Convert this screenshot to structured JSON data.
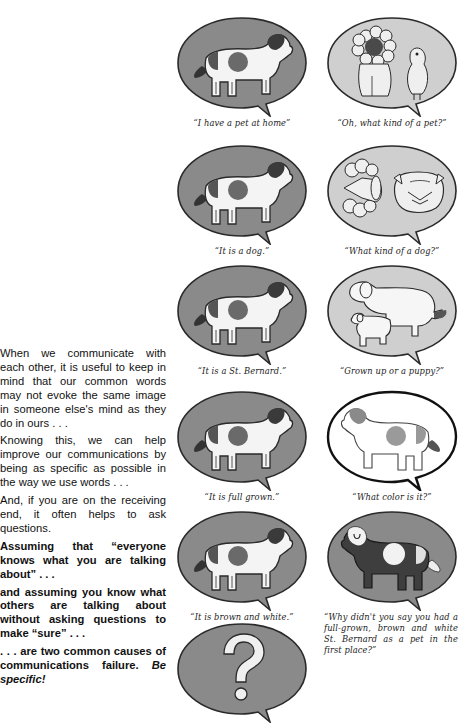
{
  "text": {
    "p1": "When we communicate with each other, it is useful to keep in mind that our common words may not evoke the same image in someone else's mind as they do in ours . . .",
    "p2": "Knowing this, we can help improve our communications by being as specific as possible in the way we use words . . .",
    "p3": "And, if you are on the receiving end, it often helps to ask questions.",
    "p4": "Assuming that “everyone knows what you are talking about” . . .",
    "p5": "and assuming you know what others are talking about without asking questions to make “sure” . . .",
    "p6_main": ". . . are two common causes of communications failure. ",
    "p6_em": "Be specific!"
  },
  "panels": [
    {
      "caption": "“I have a pet at home”",
      "image": "spotted-dog",
      "bubble": "dark"
    },
    {
      "caption": "“Oh, what kind of a pet?”",
      "image": "lion-and-bird",
      "bubble": "light"
    },
    {
      "caption": "“It is a dog.”",
      "image": "spotted-dog",
      "bubble": "dark"
    },
    {
      "caption": "“What kind of a dog?”",
      "image": "poodle-and-bulldog",
      "bubble": "light"
    },
    {
      "caption": "“It is a St. Bernard.”",
      "image": "spotted-dog",
      "bubble": "dark"
    },
    {
      "caption": "“Grown up or a puppy?”",
      "image": "dog-and-puppy",
      "bubble": "light"
    },
    {
      "caption": "“It is full grown.”",
      "image": "spotted-dog",
      "bubble": "dark"
    },
    {
      "caption": "“What color is it?”",
      "image": "outlined-dog",
      "bubble": "white"
    },
    {
      "caption": "“It is brown and white.”",
      "image": "spotted-dog",
      "bubble": "dark"
    },
    {
      "caption": "“Why didn't you say you had a full-grown, brown and white St. Bernard as a pet in the first place?”",
      "image": "dark-dog",
      "bubble": "light"
    },
    {
      "caption": "",
      "image": "question-mark",
      "bubble": "dark"
    }
  ],
  "colors": {
    "bubble_dark": "#8a8a8a",
    "bubble_light": "#cfcfcf",
    "bubble_white": "#ffffff",
    "spot": "#6e6e6e",
    "outline": "#2a2a2a"
  }
}
